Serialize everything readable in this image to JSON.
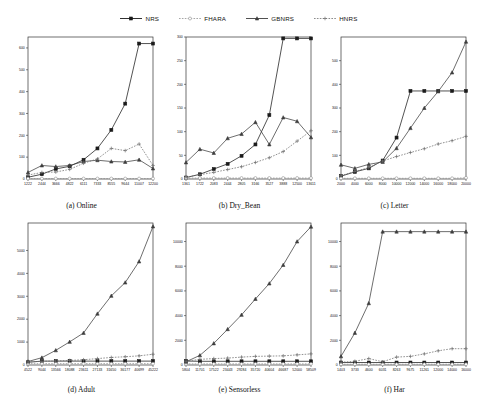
{
  "legend": {
    "items": [
      {
        "label": "NRS",
        "color": "#1a1a1a",
        "style": "solid",
        "marker": "square"
      },
      {
        "label": "FHARA",
        "color": "#8f8f8f",
        "style": "dotted",
        "marker": "circle"
      },
      {
        "label": "GBNRS",
        "color": "#3d3d3d",
        "style": "solid",
        "marker": "triangle"
      },
      {
        "label": "HNRS",
        "color": "#6e6e6e",
        "style": "dotted",
        "marker": "plus"
      }
    ]
  },
  "chart_data": [
    {
      "type": "line",
      "panel": "a",
      "title": "(a) Online",
      "xlabel": "",
      "ylabel": "",
      "categories": [
        "1222",
        "2444",
        "3666",
        "4822",
        "6111",
        "7333",
        "8555",
        "9644",
        "11007",
        "12200"
      ],
      "ylim": [
        0,
        650
      ],
      "yticks": [
        0,
        100,
        200,
        300,
        400,
        500,
        600
      ],
      "grid": false,
      "legend_position": "figure-top",
      "series": [
        {
          "name": "NRS",
          "values": [
            8,
            22,
            46,
            58,
            88,
            140,
            225,
            345,
            620,
            620
          ]
        },
        {
          "name": "FHARA",
          "values": [
            2,
            2,
            2,
            2,
            2,
            2,
            2,
            2,
            2,
            2
          ]
        },
        {
          "name": "GBNRS",
          "values": [
            30,
            62,
            57,
            62,
            80,
            86,
            80,
            78,
            88,
            48
          ]
        },
        {
          "name": "HNRS",
          "values": [
            18,
            30,
            32,
            44,
            72,
            92,
            140,
            130,
            160,
            62
          ]
        }
      ]
    },
    {
      "type": "line",
      "panel": "b",
      "title": "(b) Dry_Bean",
      "xlabel": "",
      "ylabel": "",
      "categories": [
        "1361",
        "1722",
        "2083",
        "2444",
        "2805",
        "3166",
        "3527",
        "3888",
        "12500",
        "13611"
      ],
      "ylim": [
        0,
        300
      ],
      "yticks": [
        0,
        50,
        100,
        150,
        200,
        250,
        300
      ],
      "grid": false,
      "legend_position": "figure-top",
      "series": [
        {
          "name": "NRS",
          "values": [
            3,
            10,
            21,
            32,
            49,
            73,
            135,
            297,
            297,
            297
          ]
        },
        {
          "name": "FHARA",
          "values": [
            2,
            2,
            2,
            2,
            2,
            2,
            2,
            2,
            2,
            2
          ]
        },
        {
          "name": "GBNRS",
          "values": [
            35,
            63,
            55,
            86,
            95,
            120,
            73,
            130,
            122,
            88
          ]
        },
        {
          "name": "HNRS",
          "values": [
            4,
            9,
            14,
            20,
            26,
            35,
            45,
            58,
            80,
            102
          ]
        }
      ]
    },
    {
      "type": "line",
      "panel": "c",
      "title": "(c) Letter",
      "xlabel": "",
      "ylabel": "",
      "categories": [
        "2000",
        "4000",
        "6000",
        "8000",
        "10000",
        "12000",
        "14000",
        "16000",
        "18000",
        "20000"
      ],
      "ylim": [
        0,
        600
      ],
      "yticks": [
        0,
        100,
        200,
        300,
        400,
        500
      ],
      "grid": false,
      "legend_position": "figure-top",
      "series": [
        {
          "name": "NRS",
          "values": [
            12,
            30,
            45,
            78,
            175,
            372,
            372,
            372,
            372,
            372
          ]
        },
        {
          "name": "FHARA",
          "values": [
            3,
            3,
            3,
            3,
            3,
            3,
            3,
            3,
            3,
            5
          ]
        },
        {
          "name": "GBNRS",
          "values": [
            60,
            45,
            62,
            72,
            130,
            215,
            300,
            370,
            450,
            580
          ]
        },
        {
          "name": "HNRS",
          "values": [
            14,
            32,
            48,
            76,
            95,
            112,
            128,
            148,
            162,
            180
          ]
        }
      ]
    },
    {
      "type": "line",
      "panel": "d",
      "title": "(d) Adult",
      "xlabel": "",
      "ylabel": "",
      "categories": [
        "4522",
        "9044",
        "13566",
        "18088",
        "23611",
        "27133",
        "31650",
        "36177",
        "40699",
        "45222"
      ],
      "ylim": [
        0,
        6200
      ],
      "yticks": [
        0,
        1000,
        2000,
        3000,
        4000,
        5000
      ],
      "grid": false,
      "legend_position": "figure-top",
      "series": [
        {
          "name": "NRS",
          "values": [
            120,
            170,
            170,
            170,
            170,
            170,
            170,
            170,
            170,
            170
          ]
        },
        {
          "name": "FHARA",
          "values": [
            60,
            60,
            60,
            60,
            60,
            60,
            60,
            60,
            60,
            60
          ]
        },
        {
          "name": "GBNRS",
          "values": [
            150,
            320,
            640,
            1010,
            1400,
            2240,
            3020,
            3600,
            4520,
            6050
          ]
        },
        {
          "name": "HNRS",
          "values": [
            130,
            160,
            175,
            200,
            230,
            280,
            330,
            360,
            400,
            470
          ]
        }
      ]
    },
    {
      "type": "line",
      "panel": "e",
      "title": "(e) Sensorless",
      "xlabel": "",
      "ylabel": "",
      "categories": [
        "5804",
        "11701",
        "17522",
        "23443",
        "29284",
        "35720",
        "40604",
        "46687",
        "52000",
        "58509"
      ],
      "ylim": [
        0,
        11500
      ],
      "yticks": [
        0,
        2000,
        4000,
        6000,
        8000,
        10000
      ],
      "grid": false,
      "legend_position": "figure-top",
      "series": [
        {
          "name": "NRS",
          "values": [
            320,
            300,
            300,
            300,
            300,
            300,
            300,
            300,
            300,
            300
          ]
        },
        {
          "name": "FHARA",
          "values": [
            90,
            90,
            90,
            90,
            90,
            90,
            90,
            90,
            90,
            90
          ]
        },
        {
          "name": "GBNRS",
          "values": [
            260,
            780,
            1750,
            2900,
            4060,
            5350,
            6600,
            8100,
            10000,
            11200
          ]
        },
        {
          "name": "HNRS",
          "values": [
            300,
            460,
            520,
            560,
            640,
            700,
            720,
            740,
            820,
            900
          ]
        }
      ]
    },
    {
      "type": "line",
      "panel": "f",
      "title": "(f) Har",
      "xlabel": "",
      "ylabel": "",
      "categories": [
        "1403",
        "3733",
        "4600",
        "6031",
        "8263",
        "9675",
        "11261",
        "12000",
        "14000",
        "16000"
      ],
      "ylim": [
        0,
        11500
      ],
      "yticks": [
        0,
        2000,
        4000,
        6000,
        8000,
        10000
      ],
      "grid": false,
      "legend_position": "figure-top",
      "series": [
        {
          "name": "NRS",
          "values": [
            200,
            200,
            200,
            200,
            200,
            200,
            200,
            200,
            200,
            200
          ]
        },
        {
          "name": "FHARA",
          "values": [
            60,
            60,
            60,
            60,
            60,
            60,
            60,
            60,
            60,
            60
          ]
        },
        {
          "name": "GBNRS",
          "values": [
            700,
            2600,
            5000,
            10800,
            10800,
            10800,
            10800,
            10800,
            10800,
            10800
          ]
        },
        {
          "name": "HNRS",
          "values": [
            230,
            300,
            520,
            260,
            640,
            700,
            900,
            1150,
            1320,
            1320
          ]
        }
      ]
    }
  ]
}
